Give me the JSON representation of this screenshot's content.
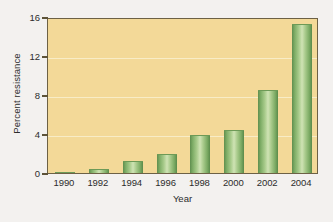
{
  "chart_data": {
    "type": "bar",
    "title": "",
    "subtitle": "",
    "xlabel": "Year",
    "ylabel": "Percent resistance",
    "categories": [
      "1990",
      "1992",
      "1994",
      "1996",
      "1998",
      "2000",
      "2002",
      "2004"
    ],
    "values": [
      0.15,
      0.4,
      1.2,
      2.0,
      3.9,
      4.4,
      8.5,
      15.3
    ],
    "series": [
      {
        "name": "Percent resistance",
        "values": [
          0.15,
          0.4,
          1.2,
          2.0,
          3.9,
          4.4,
          8.5,
          15.3
        ]
      }
    ],
    "ylim": [
      0,
      16
    ],
    "yticks": [
      0,
      4,
      8,
      12,
      16
    ],
    "ytick_labels": [
      "0",
      "4",
      "8",
      "12",
      "16"
    ],
    "xtick_labels": [
      "1990",
      "1992",
      "1994",
      "1996",
      "1998",
      "2000",
      "2002",
      "2004"
    ],
    "grid": true,
    "grid_axis": "y",
    "legend": false,
    "legend_position": "none",
    "annotations": []
  },
  "colors": {
    "plot_background": "#f3d998",
    "figure_background": "#f3f1ef",
    "bar_light": "#cfe3b4",
    "bar_mid": "#8cb873",
    "bar_dark": "#5a8a4a",
    "gridline": "#f8ecc6",
    "axis_frame": "#6d6145",
    "text": "#2c2c2c"
  }
}
